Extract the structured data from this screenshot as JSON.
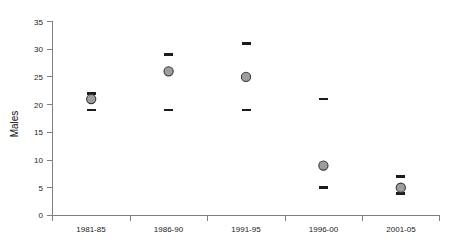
{
  "chart_data": {
    "type": "scatter",
    "title": "",
    "xlabel": "",
    "ylabel": "Males",
    "categories": [
      "1981-85",
      "1986-90",
      "1991-95",
      "1996-00",
      "2001-05"
    ],
    "values": [
      21,
      26,
      25,
      9,
      5
    ],
    "ci_upper": [
      22,
      29,
      31,
      21,
      7
    ],
    "ci_lower": [
      19,
      19,
      19,
      5,
      4
    ],
    "series": [
      {
        "name": "Males",
        "values": [
          21,
          26,
          25,
          9,
          5
        ]
      },
      {
        "name": "Upper limit",
        "values": [
          22,
          29,
          31,
          21,
          7
        ]
      },
      {
        "name": "Lower limit",
        "values": [
          19,
          19,
          19,
          5,
          4
        ]
      }
    ],
    "ylim": [
      0,
      35
    ],
    "yticks": [
      0,
      5,
      10,
      15,
      20,
      25,
      30,
      35
    ],
    "ytick_labels": [
      "0",
      "5",
      "10",
      "15",
      "20",
      "25",
      "30",
      "35"
    ],
    "grid": false,
    "legend": "none",
    "marker_color": "#9d9d9d",
    "marker_edge_color": "#3a3a3a",
    "cap_color": "#1c1c1c",
    "axis_color": "#808080"
  },
  "axes": {
    "y_title": "Males",
    "y_tick_labels": [
      "35",
      "30",
      "25",
      "20",
      "15",
      "10",
      "5",
      "0"
    ],
    "x_tick_labels": [
      "1981-85",
      "1986-90",
      "1991-95",
      "1996-00",
      "2001-05"
    ]
  }
}
